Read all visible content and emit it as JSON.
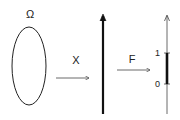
{
  "diagram": {
    "omega_label": "Ω",
    "x_label": "X",
    "f_label": "F",
    "tick_one": "1",
    "tick_zero": "0"
  },
  "colors": {
    "stroke": "#222222",
    "background": "#ffffff"
  }
}
